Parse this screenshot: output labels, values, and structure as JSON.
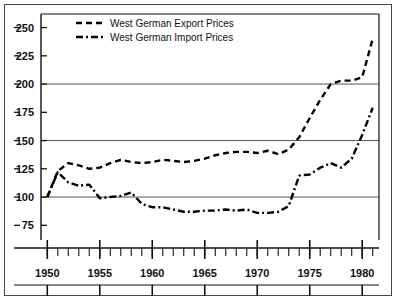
{
  "chart_data": {
    "type": "line",
    "title": "",
    "subtitle": "",
    "xlabel": "",
    "ylabel": "",
    "xlim": [
      1949.4,
      1981.6
    ],
    "ylim": [
      62,
      262
    ],
    "grid": "horizontal gridlines at 100, 150, 200",
    "legend_position": "top-left inside plot",
    "y_ticks": [
      75,
      100,
      125,
      150,
      175,
      200,
      225,
      250
    ],
    "y_tick_labels": [
      "75",
      "100",
      "125",
      "150",
      "175",
      "200",
      "225",
      "250"
    ],
    "x_ticks": [
      1950,
      1951,
      1952,
      1953,
      1954,
      1955,
      1956,
      1957,
      1958,
      1959,
      1960,
      1961,
      1962,
      1963,
      1964,
      1965,
      1966,
      1967,
      1968,
      1969,
      1970,
      1971,
      1972,
      1973,
      1974,
      1975,
      1976,
      1977,
      1978,
      1979,
      1980,
      1981
    ],
    "x_major_ticks": [
      1950,
      1955,
      1960,
      1965,
      1970,
      1975,
      1980
    ],
    "x_tick_labels": [
      "1950",
      "1955",
      "1960",
      "1965",
      "1970",
      "1975",
      "1980"
    ],
    "gridlines": [
      100,
      150,
      200
    ],
    "x": [
      1950,
      1951,
      1952,
      1953,
      1954,
      1955,
      1956,
      1957,
      1958,
      1959,
      1960,
      1961,
      1962,
      1963,
      1964,
      1965,
      1966,
      1967,
      1968,
      1969,
      1970,
      1971,
      1972,
      1973,
      1974,
      1975,
      1976,
      1977,
      1978,
      1979,
      1980,
      1981
    ],
    "series": [
      {
        "name": "West German Export Prices",
        "style": "dashed",
        "color": "#000000",
        "values": [
          100,
          123,
          130,
          128,
          125,
          126,
          130,
          133,
          131,
          130,
          131,
          133,
          132,
          131,
          132,
          134,
          137,
          139,
          140,
          140,
          139,
          141,
          138,
          142,
          153,
          170,
          186,
          200,
          203,
          203,
          206,
          240
        ]
      },
      {
        "name": "West German Import Prices",
        "style": "dash-dot",
        "color": "#000000",
        "values": [
          100,
          122,
          113,
          110,
          111,
          99,
          100,
          101,
          104,
          94,
          91,
          91,
          89,
          87,
          87,
          88,
          88,
          89,
          88,
          89,
          86,
          86,
          87,
          92,
          119,
          120,
          126,
          130,
          126,
          134,
          155,
          179
        ]
      }
    ]
  },
  "legend": {
    "entries": [
      {
        "label": "West German Export Prices",
        "marker": "dashed-line"
      },
      {
        "label": "West German Import Prices",
        "marker": "dash-dot-line"
      }
    ]
  },
  "colors": {
    "line": "#000000",
    "gridline": "#555555",
    "axis": "#111111",
    "frame": "#444444",
    "background": "#ffffff"
  }
}
